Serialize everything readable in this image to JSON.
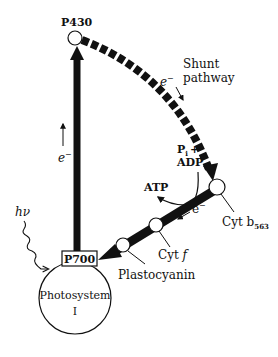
{
  "diagram": {
    "type": "cyclic electron flow around Photosystem I",
    "nodes": {
      "p430": "P430",
      "p700": "P700",
      "photosystem_line1": "Photosystem",
      "photosystem_line2": "I",
      "cyt_b563_main": "Cyt b",
      "cyt_b563_sub": "563",
      "cyt_f_main": "Cyt ",
      "cyt_f_ital": "f",
      "plastocyanin": "Plastocyanin"
    },
    "labels": {
      "shunt_line1": "Shunt",
      "shunt_line2": "pathway",
      "electron": "e",
      "electron_sup": "−",
      "pi_plus": "P",
      "pi_sub": "i",
      "plus": "+",
      "adp": "ADP",
      "atp": "ATP",
      "light": "hν"
    },
    "colors": {
      "ink": "#111111",
      "background": "#ffffff"
    }
  }
}
